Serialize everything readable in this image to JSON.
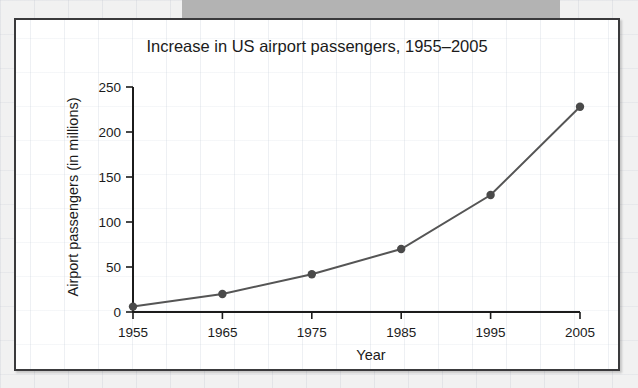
{
  "chart_data": {
    "type": "line",
    "title": "Increase in US airport passengers, 1955–2005",
    "xlabel": "Year",
    "ylabel": "Airport passengers (in millions)",
    "x": [
      1955,
      1965,
      1975,
      1985,
      1995,
      2005
    ],
    "values": [
      6,
      20,
      42,
      70,
      130,
      228
    ],
    "xtick_labels": [
      "1955",
      "1965",
      "1975",
      "1985",
      "1995",
      "2005"
    ],
    "ytick_labels": [
      "0",
      "50",
      "100",
      "150",
      "200",
      "250"
    ],
    "ytick_values": [
      0,
      50,
      100,
      150,
      200,
      250
    ],
    "xlim": [
      1955,
      2005
    ],
    "ylim": [
      0,
      250
    ],
    "grid": false,
    "legend": "none",
    "series": [
      {
        "name": "Airport passengers",
        "values": [
          6,
          20,
          42,
          70,
          130,
          228
        ]
      }
    ],
    "marker": "circle",
    "line_color": "#555555",
    "marker_color": "#4a4a4a",
    "axis_color": "#1b1b1b",
    "plot_background": "#ffffff"
  },
  "figure": {
    "frame_border_color": "#3a3a3c",
    "page_background": "#f1f1f1",
    "top_band_color": "#b3b3b3"
  }
}
